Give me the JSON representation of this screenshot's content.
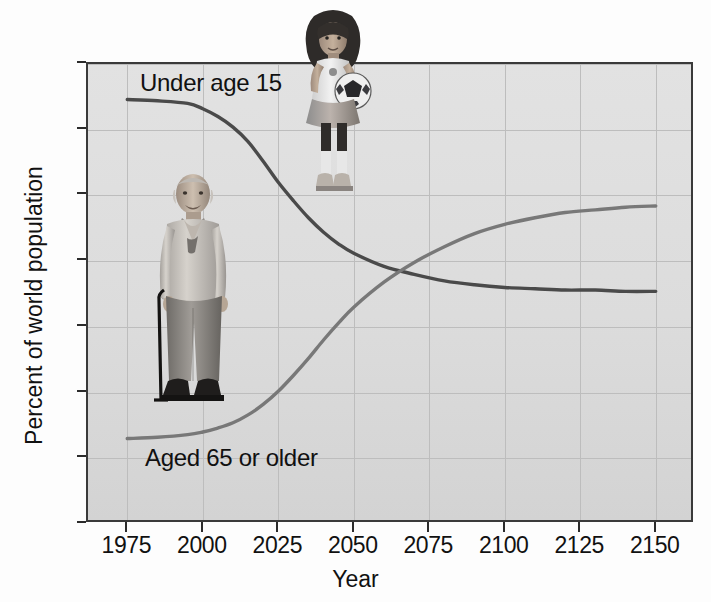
{
  "chart_data": {
    "type": "line",
    "title": "",
    "xlabel": "Year",
    "ylabel": "Percent of world population",
    "xlim": [
      1962,
      2163
    ],
    "ylim": [
      0,
      35
    ],
    "xticks": [
      "1975",
      "2000",
      "2025",
      "2050",
      "2075",
      "2100",
      "2125",
      "2150"
    ],
    "xtick_values": [
      1975,
      2000,
      2025,
      2050,
      2075,
      2100,
      2125,
      2150
    ],
    "yticks": [
      "0",
      "5",
      "10",
      "15",
      "20",
      "25",
      "30",
      "35"
    ],
    "ytick_values": [
      0,
      5,
      10,
      15,
      20,
      25,
      30,
      35
    ],
    "grid": true,
    "legend": "inline-labels",
    "x": [
      1975,
      1985,
      1995,
      2000,
      2005,
      2010,
      2015,
      2020,
      2025,
      2030,
      2035,
      2040,
      2045,
      2050,
      2060,
      2070,
      2080,
      2090,
      2100,
      2110,
      2120,
      2130,
      2140,
      2150
    ],
    "series": [
      {
        "name": "Under age 15",
        "label": "Under age 15",
        "color": "#4a4a4a",
        "values": [
          32.3,
          32.2,
          32.0,
          31.6,
          31.0,
          30.2,
          29.1,
          27.6,
          26.0,
          24.6,
          23.3,
          22.2,
          21.3,
          20.6,
          19.6,
          19.0,
          18.5,
          18.2,
          18.0,
          17.9,
          17.8,
          17.8,
          17.7,
          17.7
        ]
      },
      {
        "name": "Aged 65 or older",
        "label": "Aged 65 or older",
        "color": "#787878",
        "values": [
          6.5,
          6.6,
          6.8,
          7.0,
          7.3,
          7.7,
          8.3,
          9.1,
          10.1,
          11.3,
          12.6,
          14.0,
          15.3,
          16.5,
          18.4,
          19.9,
          21.1,
          22.1,
          22.8,
          23.3,
          23.7,
          23.9,
          24.1,
          24.2
        ]
      }
    ],
    "annotations": [
      {
        "text": "Under age 15",
        "near_x": 1985,
        "near_y": 34.0
      },
      {
        "text": "Aged 65 or older",
        "near_x": 1988,
        "near_y": 5.3
      }
    ],
    "images": [
      {
        "name": "girl-with-soccer-ball-photo",
        "description": "photo of young girl holding a soccer ball"
      },
      {
        "name": "elderly-man-with-cane-photo",
        "description": "photo of elderly man standing with a cane"
      }
    ]
  },
  "axes": {
    "x_title": "Year",
    "y_title": "Percent of world population"
  }
}
